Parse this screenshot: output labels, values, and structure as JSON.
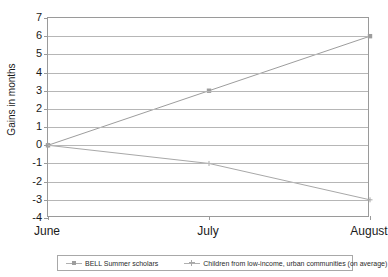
{
  "chart_data": {
    "type": "line",
    "title": "",
    "xlabel": "",
    "ylabel": "Gains in months",
    "categories": [
      "June",
      "July",
      "August"
    ],
    "ylim": [
      -4,
      7
    ],
    "yticks": [
      7,
      6,
      5,
      4,
      3,
      2,
      1,
      0,
      -1,
      -2,
      -3,
      -4
    ],
    "grid": true,
    "legend_position": "bottom",
    "series": [
      {
        "name": "BELL Summer scholars",
        "values": [
          0,
          3,
          6
        ],
        "marker": "square",
        "color": "#9d9d9d"
      },
      {
        "name": "Children from low-income, urban communities (on average)",
        "values": [
          0,
          -1,
          -3
        ],
        "marker": "cross",
        "color": "#a8a8a8"
      }
    ]
  },
  "axis": {
    "y_title": "Gains in months",
    "y_tick_labels": [
      "7",
      "6",
      "5",
      "4",
      "3",
      "2",
      "1",
      "0",
      "-1",
      "-2",
      "-3",
      "-4"
    ],
    "x_tick_labels": [
      "June",
      "July",
      "August"
    ]
  },
  "legend": {
    "entries": [
      {
        "label": "BELL Summer scholars",
        "marker": "square"
      },
      {
        "label": "Children from low-income, urban communities (on average)",
        "marker": "cross"
      }
    ]
  }
}
